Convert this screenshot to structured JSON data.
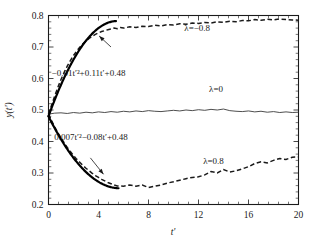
{
  "chart_data": {
    "type": "line",
    "title": "",
    "xlabel": "t'",
    "ylabel": "y(t')",
    "xlim": [
      0,
      20
    ],
    "ylim": [
      0.2,
      0.8
    ],
    "xticks": [
      "0",
      "4",
      "8",
      "12",
      "16",
      "20"
    ],
    "xtick_values": [
      0,
      4,
      8,
      12,
      16,
      20
    ],
    "yticks": [
      "0.2",
      "0.3",
      "0.4",
      "0.5",
      "0.6",
      "0.7",
      "0.8"
    ],
    "ytick_values": [
      0.2,
      0.3,
      0.4,
      0.5,
      0.6,
      0.7,
      0.8
    ],
    "minor_ticks_per_interval": 4,
    "grid": false,
    "legend_position": "inline-annotations",
    "series": [
      {
        "name": "lambda=-0.8",
        "label": "λ=−0.8",
        "label_x": 11.9,
        "label_y": 0.752,
        "style": "dashed",
        "x": [
          0,
          0.25,
          0.5,
          0.75,
          1,
          1.25,
          1.5,
          1.75,
          2,
          2.25,
          2.5,
          2.75,
          3,
          3.25,
          3.5,
          3.75,
          4,
          4.25,
          4.5,
          4.75,
          5,
          5.25,
          5.5,
          5.75,
          6,
          6.5,
          7,
          7.5,
          8,
          8.5,
          9,
          9.5,
          10,
          10.5,
          11,
          11.5,
          12,
          12.5,
          13,
          13.5,
          14,
          14.5,
          15,
          15.5,
          16,
          16.5,
          17,
          17.5,
          18,
          18.5,
          19,
          19.5,
          20
        ],
        "y": [
          0.487,
          0.516,
          0.545,
          0.572,
          0.597,
          0.619,
          0.639,
          0.657,
          0.673,
          0.687,
          0.699,
          0.71,
          0.719,
          0.727,
          0.734,
          0.74,
          0.745,
          0.749,
          0.752,
          0.755,
          0.757,
          0.76,
          0.758,
          0.762,
          0.76,
          0.764,
          0.762,
          0.766,
          0.765,
          0.769,
          0.767,
          0.771,
          0.77,
          0.774,
          0.772,
          0.776,
          0.775,
          0.778,
          0.776,
          0.78,
          0.778,
          0.782,
          0.78,
          0.784,
          0.783,
          0.787,
          0.785,
          0.788,
          0.786,
          0.789,
          0.787,
          0.786,
          0.785
        ]
      },
      {
        "name": "lambda=0",
        "label": "λ=0",
        "label_x": 13.4,
        "label_y": 0.556,
        "style": "solid",
        "x": [
          0,
          0.5,
          1,
          1.5,
          2,
          2.5,
          3,
          3.5,
          4,
          4.5,
          5,
          5.5,
          6,
          6.5,
          7,
          7.5,
          8,
          8.5,
          9,
          9.5,
          10,
          10.5,
          11,
          11.5,
          12,
          12.5,
          13,
          13.5,
          14,
          14.5,
          15,
          15.5,
          16,
          16.5,
          17,
          17.5,
          18,
          18.5,
          19,
          19.5,
          20
        ],
        "y": [
          0.487,
          0.49,
          0.491,
          0.489,
          0.492,
          0.49,
          0.493,
          0.491,
          0.494,
          0.492,
          0.495,
          0.493,
          0.496,
          0.494,
          0.497,
          0.495,
          0.498,
          0.496,
          0.495,
          0.497,
          0.499,
          0.497,
          0.5,
          0.498,
          0.501,
          0.499,
          0.502,
          0.5,
          0.503,
          0.498,
          0.496,
          0.495,
          0.497,
          0.494,
          0.496,
          0.493,
          0.495,
          0.492,
          0.494,
          0.492,
          0.493
        ]
      },
      {
        "name": "lambda=0.8",
        "label": "λ=0.8",
        "label_x": 13.2,
        "label_y": 0.327,
        "style": "dashed",
        "x": [
          0,
          0.25,
          0.5,
          0.75,
          1,
          1.25,
          1.5,
          1.75,
          2,
          2.25,
          2.5,
          2.75,
          3,
          3.25,
          3.5,
          3.75,
          4,
          4.25,
          4.5,
          4.75,
          5,
          5.25,
          5.5,
          6,
          6.5,
          7,
          7.5,
          8,
          8.5,
          9,
          9.5,
          10,
          10.5,
          11,
          11.5,
          12,
          12.5,
          13,
          13.5,
          14,
          14.5,
          15,
          15.5,
          16,
          16.5,
          17,
          17.5,
          18,
          18.5,
          19,
          19.5,
          20
        ],
        "y": [
          0.487,
          0.466,
          0.446,
          0.428,
          0.411,
          0.396,
          0.381,
          0.368,
          0.356,
          0.344,
          0.334,
          0.324,
          0.315,
          0.307,
          0.299,
          0.292,
          0.286,
          0.28,
          0.275,
          0.27,
          0.266,
          0.262,
          0.259,
          0.258,
          0.262,
          0.258,
          0.262,
          0.254,
          0.258,
          0.262,
          0.268,
          0.272,
          0.277,
          0.282,
          0.286,
          0.288,
          0.294,
          0.305,
          0.3,
          0.311,
          0.303,
          0.307,
          0.313,
          0.32,
          0.33,
          0.336,
          0.332,
          0.34,
          0.346,
          0.343,
          0.35,
          0.351
        ]
      }
    ],
    "fit_curves": [
      {
        "name": "upper-fit",
        "equation": "−0.01t′²+0.11t′+0.48",
        "coeffs": {
          "a": -0.01,
          "b": 0.11,
          "c": 0.48
        },
        "x_start": 0,
        "x_end": 5.4,
        "label_x": 3.2,
        "label_y": 0.608,
        "arrow_from_x": 5.0,
        "arrow_from_y": 0.7,
        "arrow_to_x": 4.05,
        "arrow_to_y": 0.735
      },
      {
        "name": "lower-fit",
        "equation": "0.007t′²−0.08t′+0.48",
        "coeffs": {
          "a": 0.007,
          "b": -0.08,
          "c": 0.48
        },
        "x_start": 0,
        "x_end": 5.6,
        "label_x": 3.4,
        "label_y": 0.406,
        "arrow_from_x": 3.35,
        "arrow_from_y": 0.348,
        "arrow_to_x": 4.4,
        "arrow_to_y": 0.296
      }
    ],
    "colors": {
      "axis": "#1a1a1a",
      "data_solid": "#3a3a3a",
      "data_dashed": "#1a1a1a",
      "fit": "#000000",
      "background": "#ffffff"
    }
  }
}
